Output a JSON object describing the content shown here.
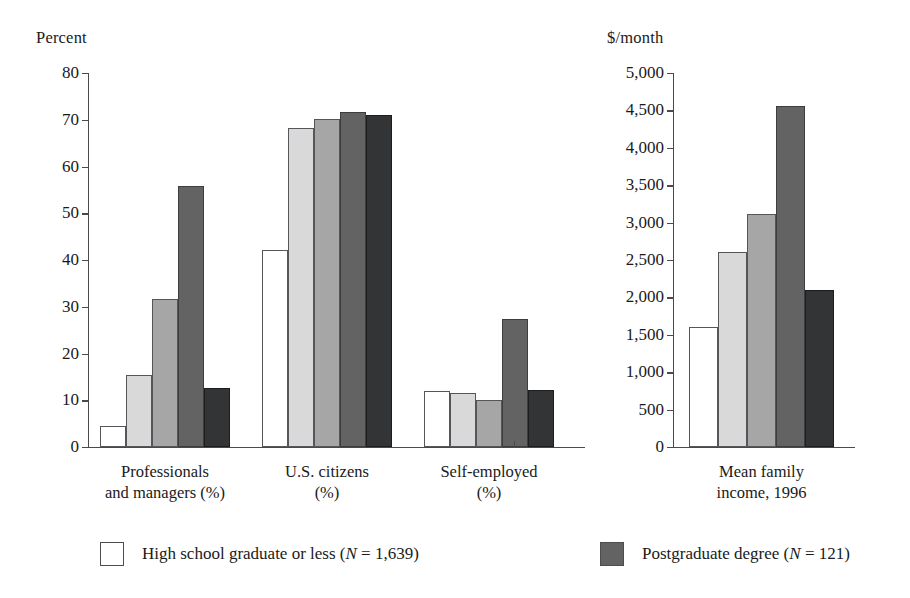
{
  "chart_data": [
    {
      "id": "left",
      "type": "bar",
      "title": "",
      "ylabel": "Percent",
      "xlabel": "",
      "ylim": [
        0,
        80
      ],
      "ytick_step": 10,
      "ytick_labels": [
        "0",
        "10",
        "20",
        "30",
        "40",
        "50",
        "60",
        "70",
        "80"
      ],
      "grid": false,
      "categories": [
        "Professionals and managers (%)",
        "U.S. citizens (%)",
        "Self-employed (%)"
      ],
      "category_lines": [
        [
          "Professionals",
          "and managers (%)"
        ],
        [
          "U.S. citizens",
          "(%)"
        ],
        [
          "Self-employed",
          "(%)"
        ]
      ],
      "series": [
        {
          "name": "High school graduate or less",
          "values": [
            4.5,
            42.2,
            12.0
          ]
        },
        {
          "name": "Some college",
          "values": [
            15.5,
            68.2,
            11.5
          ]
        },
        {
          "name": "College graduate",
          "values": [
            31.6,
            70.2,
            10.1
          ]
        },
        {
          "name": "Postgraduate degree",
          "values": [
            55.9,
            71.7,
            27.4
          ]
        },
        {
          "name": "Other",
          "values": [
            12.7,
            71.1,
            12.3
          ]
        }
      ]
    },
    {
      "id": "right",
      "type": "bar",
      "title": "",
      "ylabel": "$/month",
      "xlabel": "",
      "ylim": [
        0,
        5000
      ],
      "ytick_step": 500,
      "ytick_labels": [
        "0",
        "500",
        "1,000",
        "1,500",
        "2,000",
        "2,500",
        "3,000",
        "3,500",
        "4,000",
        "4,500",
        "5,000"
      ],
      "grid": false,
      "categories": [
        "Mean family income, 1996"
      ],
      "category_lines": [
        [
          "Mean family",
          "income, 1996"
        ]
      ],
      "series": [
        {
          "name": "High school graduate or less",
          "values": [
            1600
          ]
        },
        {
          "name": "Some college",
          "values": [
            2610
          ]
        },
        {
          "name": "College graduate",
          "values": [
            3120
          ]
        },
        {
          "name": "Postgraduate degree",
          "values": [
            4555
          ]
        },
        {
          "name": "Other",
          "values": [
            2105
          ]
        }
      ]
    }
  ],
  "legend": {
    "position": "bottom",
    "items": [
      {
        "label_pre": "High school graduate or less (",
        "label_italic": "N",
        "label_post": " = 1,639)",
        "swatch": "#ffffff"
      },
      {
        "label_pre": "Postgraduate degree (",
        "label_italic": "N",
        "label_post": " = 121)",
        "swatch": "#636363"
      }
    ]
  },
  "palette": {
    "series_0": "#ffffff",
    "series_1": "#d9d9d9",
    "series_2": "#a6a6a6",
    "series_3": "#636363",
    "series_4": "#333436",
    "axis": "#4a4a4a",
    "text": "#1a1a1a"
  }
}
